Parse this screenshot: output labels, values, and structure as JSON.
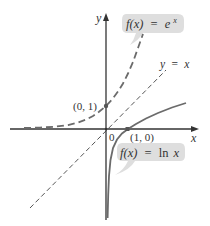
{
  "axes": {
    "x_label": "x",
    "y_label": "y",
    "origin_label": "0"
  },
  "curves": {
    "exp": {
      "label_fx": "f(x)",
      "label_eq": "=",
      "label_rhs": "e",
      "label_sup": "x",
      "style": "dashed",
      "color": "#6b6b6b"
    },
    "ln": {
      "label_fx": "f(x)",
      "label_eq": "=",
      "label_rhs": "ln",
      "label_var": "x",
      "style": "solid",
      "color": "#6b6b6b"
    },
    "identity": {
      "label": "y  =  x",
      "style": "dashed",
      "color": "#555555"
    }
  },
  "points": {
    "p01": "(0, 1)",
    "p10": "(1, 0)"
  },
  "colors": {
    "bubble": "#dedede",
    "axis": "#333333",
    "point": "#555555"
  }
}
